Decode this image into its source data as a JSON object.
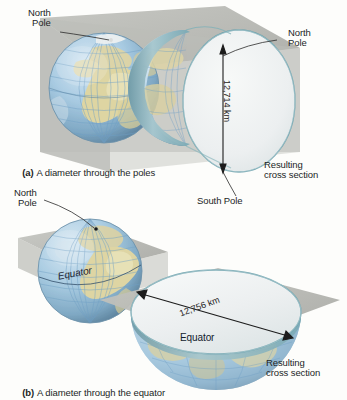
{
  "figure": {
    "background_color": "#fdfdfb",
    "plane_color": "#b9bab5",
    "cross_section_face_color": "#eef1f0",
    "cross_section_rim_color": "#7fb0b8",
    "ocean_color": "#9cc4de",
    "land_color": "#ded6a8",
    "graticule_color": "#6f9fc4",
    "leader_line_color": "#2b2b2b"
  },
  "panel_a": {
    "caption_prefix": "(a)",
    "caption_text": "A diameter through the poles",
    "labels": {
      "north_pole_globe": "North\nPole",
      "north_pole_section": "North\nPole",
      "south_pole": "South Pole",
      "resulting_cross_section": "Resulting\ncross section"
    },
    "dimension": {
      "value": "12,714 km",
      "orientation": "vertical",
      "meaning": "polar diameter"
    }
  },
  "panel_b": {
    "caption_prefix": "(b)",
    "caption_text": "A diameter through the equator",
    "labels": {
      "north_pole_globe": "North\nPole",
      "equator_globe": "Equator",
      "equator_section": "Equator",
      "resulting_cross_section": "Resulting\ncross section"
    },
    "dimension": {
      "value": "12,756 km",
      "orientation": "diagonal",
      "meaning": "equatorial diameter"
    }
  }
}
